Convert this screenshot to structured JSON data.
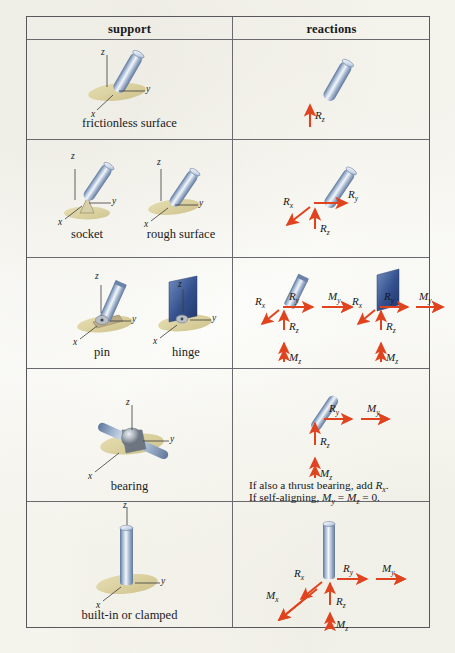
{
  "table": {
    "headers": {
      "support": "support",
      "reactions": "reactions"
    },
    "rows": [
      {
        "id": "frictionless-surface",
        "supports": [
          {
            "caption": "frictionless surface",
            "axes": [
              "z",
              "y",
              "x"
            ]
          }
        ],
        "reactions": [
          {
            "label": "R",
            "sub": "z",
            "dir": "up",
            "type": "force"
          }
        ]
      },
      {
        "id": "socket-rough-surface",
        "supports": [
          {
            "caption": "socket",
            "axes": [
              "z",
              "y",
              "x"
            ]
          },
          {
            "caption": "rough surface",
            "axes": [
              "z",
              "y",
              "x"
            ]
          }
        ],
        "reactions": [
          {
            "label": "R",
            "sub": "x",
            "dir": "down-left",
            "type": "force"
          },
          {
            "label": "R",
            "sub": "y",
            "dir": "right",
            "type": "force"
          },
          {
            "label": "R",
            "sub": "z",
            "dir": "up",
            "type": "force"
          }
        ]
      },
      {
        "id": "pin-hinge",
        "supports": [
          {
            "caption": "pin",
            "axes": [
              "z",
              "y",
              "x"
            ]
          },
          {
            "caption": "hinge",
            "axes": [
              "z",
              "y",
              "x"
            ]
          }
        ],
        "reactions": [
          {
            "label": "R",
            "sub": "x",
            "dir": "down-left",
            "type": "force"
          },
          {
            "label": "R",
            "sub": "y",
            "dir": "right",
            "type": "force"
          },
          {
            "label": "M",
            "sub": "y",
            "dir": "right",
            "type": "moment"
          },
          {
            "label": "R",
            "sub": "z",
            "dir": "up",
            "type": "force"
          },
          {
            "label": "M",
            "sub": "z",
            "dir": "up",
            "type": "moment"
          }
        ],
        "reactions_second": [
          {
            "label": "R",
            "sub": "x",
            "dir": "down-left",
            "type": "force"
          },
          {
            "label": "R",
            "sub": "y",
            "dir": "right",
            "type": "force"
          },
          {
            "label": "M",
            "sub": "y",
            "dir": "right",
            "type": "moment"
          },
          {
            "label": "R",
            "sub": "z",
            "dir": "up",
            "type": "force"
          },
          {
            "label": "M",
            "sub": "z",
            "dir": "up",
            "type": "moment"
          }
        ]
      },
      {
        "id": "bearing",
        "supports": [
          {
            "caption": "bearing",
            "axes": [
              "z",
              "y",
              "x"
            ]
          }
        ],
        "reactions": [
          {
            "label": "R",
            "sub": "y",
            "dir": "right",
            "type": "force"
          },
          {
            "label": "M",
            "sub": "y",
            "dir": "right",
            "type": "moment"
          },
          {
            "label": "R",
            "sub": "z",
            "dir": "up",
            "type": "force"
          },
          {
            "label": "M",
            "sub": "z",
            "dir": "up",
            "type": "moment"
          }
        ],
        "notes": [
          {
            "text_before": "If also a thrust bearing, add ",
            "sym": "R",
            "sub": "x",
            "text_after": "."
          },
          {
            "text_before": "If self-aligning, ",
            "sym": "M",
            "sub": "y",
            "mid": " = ",
            "sym2": "M",
            "sub2": "z",
            "text_after": " = 0."
          }
        ]
      },
      {
        "id": "built-in-clamped",
        "supports": [
          {
            "caption": "built-in or clamped",
            "axes": [
              "z",
              "y",
              "x"
            ]
          }
        ],
        "reactions": [
          {
            "label": "R",
            "sub": "x",
            "dir": "down-left",
            "type": "force"
          },
          {
            "label": "M",
            "sub": "x",
            "dir": "down-left",
            "type": "moment"
          },
          {
            "label": "R",
            "sub": "y",
            "dir": "right",
            "type": "force"
          },
          {
            "label": "M",
            "sub": "y",
            "dir": "right",
            "type": "moment"
          },
          {
            "label": "R",
            "sub": "z",
            "dir": "up",
            "type": "force"
          },
          {
            "label": "M",
            "sub": "z",
            "dir": "up",
            "type": "moment"
          }
        ]
      }
    ]
  },
  "colors": {
    "arrow": "#e0441f",
    "rod_light": "#eef2f8",
    "rod_mid": "#9fb2cd",
    "rod_dark": "#5d769b",
    "plate": "#3d5894",
    "ground": "#d8cf9a",
    "rule": "#6a6a6e"
  },
  "labels": {
    "Rx": "R",
    "Rx_sub": "x",
    "Ry": "R",
    "Ry_sub": "y",
    "Rz": "R",
    "Rz_sub": "z",
    "Mx": "M",
    "Mx_sub": "x",
    "My": "M",
    "My_sub": "y",
    "Mz": "M",
    "Mz_sub": "z",
    "axis_x": "x",
    "axis_y": "y",
    "axis_z": "z"
  },
  "captions": {
    "r1c1": "frictionless surface",
    "r2c1": "socket",
    "r2c2": "rough surface",
    "r3c1": "pin",
    "r3c2": "hinge",
    "r4c1": "bearing",
    "r5c1": "built-in or clamped"
  },
  "notes": {
    "line1_a": "If also a thrust bearing, add ",
    "line1_b": ".",
    "line2_a": "If self-aligning, ",
    "line2_mid": " = ",
    "line2_b": " = 0."
  }
}
